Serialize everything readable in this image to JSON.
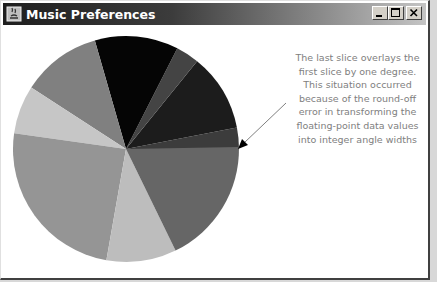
{
  "window": {
    "title": "Music Preferences",
    "controls": {
      "minimize": "minimize",
      "maximize": "maximize",
      "close": "close"
    }
  },
  "annotation": {
    "text": "The last slice overlays the\nfirst slice by one degree.\nThis situation occurred\nbecause of the round-off\nerror in transforming the\nfloating-point data values\ninto integer angle widths"
  },
  "chart_data": {
    "type": "pie",
    "title": "Music Preferences",
    "center": [
      125,
      148
    ],
    "radius": 113,
    "note": "Last slice overlays the first slice by one degree due to round-off error",
    "slices": [
      {
        "start_deg": 0,
        "end_deg": 11,
        "width_deg": 11,
        "color": "#3c3c3c"
      },
      {
        "start_deg": 11,
        "end_deg": 51,
        "width_deg": 40,
        "color": "#1c1c1c"
      },
      {
        "start_deg": 51,
        "end_deg": 63,
        "width_deg": 12,
        "color": "#444444"
      },
      {
        "start_deg": 63,
        "end_deg": 106,
        "width_deg": 43,
        "color": "#050505"
      },
      {
        "start_deg": 106,
        "end_deg": 147,
        "width_deg": 41,
        "color": "#808080"
      },
      {
        "start_deg": 147,
        "end_deg": 172,
        "width_deg": 25,
        "color": "#c6c6c6"
      },
      {
        "start_deg": 172,
        "end_deg": 260,
        "width_deg": 88,
        "color": "#959595"
      },
      {
        "start_deg": 260,
        "end_deg": 296,
        "width_deg": 36,
        "color": "#bdbdbd"
      },
      {
        "start_deg": 296,
        "end_deg": 361,
        "width_deg": 65,
        "color": "#666666"
      }
    ]
  }
}
